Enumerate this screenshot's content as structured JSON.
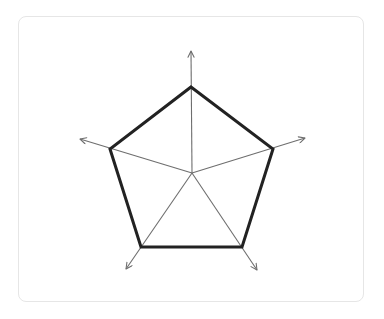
{
  "diagram": {
    "type": "radar-axes-pentagon",
    "center": [
      192,
      173
    ],
    "colors": {
      "axis": "#6e6e6e",
      "outline": "#222222",
      "card_border": "#e6e6e6",
      "background": "#ffffff"
    },
    "axes": [
      {
        "name": "axis-top",
        "tip": [
          191,
          51
        ]
      },
      {
        "name": "axis-right",
        "tip": [
          305,
          138
        ]
      },
      {
        "name": "axis-bottom-right",
        "tip": [
          257,
          270
        ]
      },
      {
        "name": "axis-bottom-left",
        "tip": [
          126,
          269
        ]
      },
      {
        "name": "axis-left",
        "tip": [
          80,
          139
        ]
      }
    ],
    "pentagon": {
      "vertices": [
        [
          191,
          87
        ],
        [
          273,
          149
        ],
        [
          242,
          247
        ],
        [
          141,
          247
        ],
        [
          110,
          149
        ]
      ],
      "stroke_width": 3
    }
  }
}
